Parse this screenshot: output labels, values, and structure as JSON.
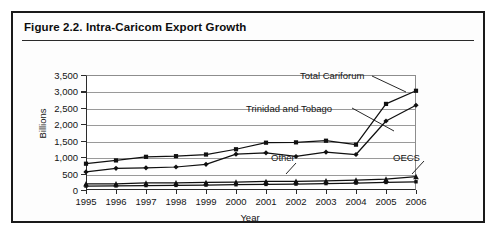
{
  "figure": {
    "caption": "Figure 2.2.  Intra-Caricom Export Growth"
  },
  "chart_data": {
    "type": "line",
    "title": "Intra-Caricom Export Growth",
    "xlabel": "Year",
    "ylabel": "Billions",
    "categories": [
      1995,
      1996,
      1997,
      1998,
      1999,
      2000,
      2001,
      2002,
      2003,
      2004,
      2005,
      2006
    ],
    "x": [
      "1995",
      "1996",
      "1997",
      "1998",
      "1999",
      "2000",
      "2001",
      "2002",
      "2003",
      "2004",
      "2005",
      "2006"
    ],
    "ylim": [
      0,
      3500
    ],
    "xlim": [
      1995,
      2006
    ],
    "yticks": [
      "0",
      "500",
      "1,000",
      "1,500",
      "2,000",
      "2,500",
      "3,000",
      "3,500"
    ],
    "ytick_values": [
      0,
      500,
      1000,
      1500,
      2000,
      2500,
      3000,
      3500
    ],
    "grid": true,
    "legend_position": "inline-annotations",
    "series": [
      {
        "name": "Total Cariforum",
        "marker": "square",
        "values": [
          800,
          900,
          1010,
          1030,
          1080,
          1240,
          1440,
          1450,
          1500,
          1380,
          2620,
          3020
        ]
      },
      {
        "name": "Trinidad and Tobago",
        "marker": "diamond",
        "values": [
          550,
          660,
          675,
          700,
          780,
          1090,
          1130,
          1020,
          1150,
          1080,
          2100,
          2580
        ]
      },
      {
        "name": "Other",
        "marker": "triangle",
        "values": [
          190,
          190,
          215,
          220,
          230,
          240,
          260,
          265,
          280,
          300,
          330,
          410
        ]
      },
      {
        "name": "OECS",
        "marker": "square-small",
        "values": [
          120,
          125,
          135,
          140,
          150,
          160,
          170,
          180,
          195,
          210,
          230,
          250
        ]
      }
    ],
    "annotations": [
      {
        "text": "Total Cariforum",
        "target_series": "Total Cariforum"
      },
      {
        "text": "Trinidad and Tobago",
        "target_series": "Trinidad and Tobago"
      },
      {
        "text": "Other",
        "target_series": "Other"
      },
      {
        "text": "OECS",
        "target_series": "OECS"
      }
    ],
    "colors": {
      "line": "#101010",
      "grid": "#9a9a9a",
      "axis": "#2b2b2b",
      "background": "#ffffff"
    }
  }
}
